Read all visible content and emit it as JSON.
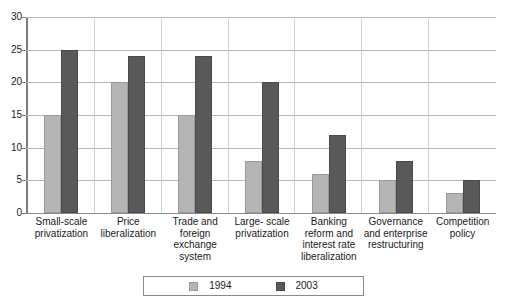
{
  "chart_data": {
    "type": "bar",
    "title": "",
    "subtitle": "",
    "xlabel": "",
    "ylabel": "",
    "ylim": [
      0,
      30
    ],
    "ytick_values": [
      0,
      5,
      10,
      15,
      20,
      25,
      30
    ],
    "ytick_labels": [
      "0",
      "5",
      "10",
      "15",
      "20",
      "25",
      "30"
    ],
    "grid": true,
    "legend_position": "bottom-center",
    "categories": [
      "Small-scale privatization",
      "Price liberalization",
      "Trade and foreign exchange system",
      "Large- scale privatization",
      "Banking reform and interest rate liberalization",
      "Governance and enterprise restructuring",
      "Competition policy"
    ],
    "category_lines": [
      [
        "Small-scale",
        "privatization"
      ],
      [
        "Price",
        "liberalization"
      ],
      [
        "Trade and",
        "foreign",
        "exchange",
        "system"
      ],
      [
        "Large- scale",
        "privatization"
      ],
      [
        "Banking",
        "reform and",
        "interest rate",
        "liberalization"
      ],
      [
        "Governance",
        "and enterprise",
        "restructuring"
      ],
      [
        "Competition",
        "policy"
      ]
    ],
    "series": [
      {
        "name": "1994",
        "color": "#b5b5b5",
        "values": [
          15,
          20,
          15,
          8,
          6,
          5,
          3
        ]
      },
      {
        "name": "2003",
        "color": "#595959",
        "values": [
          25,
          24,
          24,
          20,
          12,
          8,
          5
        ]
      }
    ]
  },
  "legend": {
    "entries": [
      {
        "label": "1994",
        "color": "#b5b5b5"
      },
      {
        "label": "2003",
        "color": "#595959"
      }
    ]
  },
  "colors": {
    "series_1994": "#b5b5b5",
    "series_2003": "#595959",
    "gridline": "#b8b8b8",
    "axis": "#7d7d7d",
    "text": "#1a1a1a",
    "background": "#ffffff"
  }
}
